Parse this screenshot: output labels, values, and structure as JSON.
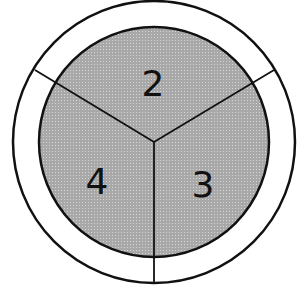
{
  "diagram": {
    "type": "divided-circle",
    "center": [
      154,
      142
    ],
    "outer_radius": 141,
    "inner_radius": 115,
    "colors": {
      "stroke": "#111111",
      "ring_fill": "#ffffff",
      "inner_fill": "#a8a8a8",
      "dot": "#d6d6d6"
    },
    "dividers": [
      {
        "name": "divider-upper-left",
        "x2": 35,
        "y2": 70
      },
      {
        "name": "divider-upper-right",
        "x2": 274,
        "y2": 70
      },
      {
        "name": "divider-bottom",
        "x2": 154,
        "y2": 283
      }
    ],
    "sections": [
      {
        "name": "section-top",
        "label": "2",
        "x": 153,
        "y": 96
      },
      {
        "name": "section-left",
        "label": "4",
        "x": 97,
        "y": 194
      },
      {
        "name": "section-right",
        "label": "3",
        "x": 203,
        "y": 197
      }
    ]
  }
}
